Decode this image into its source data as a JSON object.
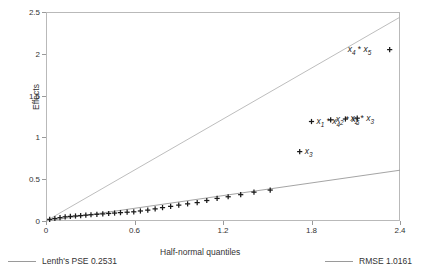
{
  "chart_data": {
    "type": "scatter",
    "title": "",
    "xlabel": "Half-normal quantiles",
    "ylabel": "Effects",
    "xlim": [
      0,
      2.4
    ],
    "ylim": [
      0,
      2.5
    ],
    "xticks": [
      "0",
      "0.6",
      "1.2",
      "1.8",
      "2.4"
    ],
    "xtick_values": [
      0,
      0.6,
      1.2,
      1.8,
      2.4
    ],
    "yticks": [
      "0",
      "0.5",
      "1",
      "1.5",
      "2",
      "2.5"
    ],
    "ytick_values": [
      0,
      0.5,
      1,
      1.5,
      2,
      2.5
    ],
    "grid": false,
    "marker": "plus",
    "x": [
      0.025,
      0.06,
      0.095,
      0.13,
      0.165,
      0.2,
      0.235,
      0.27,
      0.305,
      0.345,
      0.385,
      0.425,
      0.465,
      0.505,
      0.55,
      0.595,
      0.64,
      0.69,
      0.74,
      0.79,
      0.845,
      0.9,
      0.96,
      1.025,
      1.09,
      1.16,
      1.235,
      1.32,
      1.41,
      1.52,
      1.72,
      1.8,
      1.93,
      2.03,
      2.11,
      2.33
    ],
    "y": [
      0.02,
      0.03,
      0.04,
      0.05,
      0.055,
      0.06,
      0.065,
      0.07,
      0.075,
      0.08,
      0.085,
      0.09,
      0.095,
      0.1,
      0.105,
      0.11,
      0.12,
      0.13,
      0.145,
      0.16,
      0.175,
      0.19,
      0.205,
      0.22,
      0.245,
      0.27,
      0.29,
      0.315,
      0.345,
      0.37,
      0.83,
      1.19,
      1.21,
      1.22,
      1.23,
      2.05
    ],
    "point_labels": [
      {
        "text": "x_3",
        "x": 1.72,
        "y": 0.83,
        "side": "right"
      },
      {
        "text": "x_1 * x_4",
        "x": 1.8,
        "y": 1.19,
        "side": "right"
      },
      {
        "text": "x_2 * x_5",
        "x": 1.93,
        "y": 1.21,
        "side": "right"
      },
      {
        "text": "x_2 * x_3",
        "x": 2.03,
        "y": 1.22,
        "side": "right"
      },
      {
        "text": "x_4 * x_5",
        "x": 2.33,
        "y": 2.05,
        "side": "left"
      }
    ],
    "reference_lines": [
      {
        "name": "Lenth's PSE",
        "value": 0.2531,
        "slope": 1.0161,
        "intercept": 0,
        "color": "#b5b5b5",
        "style": "solid"
      },
      {
        "name": "RMSE",
        "value": 1.0161,
        "slope": 0.2531,
        "intercept": 0,
        "color": "#9a9a9a",
        "style": "solid"
      }
    ]
  },
  "axes": {
    "ylabel": "Effects",
    "xlabel": "Half-normal quantiles"
  },
  "labels": {
    "x3": {
      "var": "x",
      "sub": "3",
      "op": "",
      "var2": "",
      "sub2": ""
    },
    "x1x4": {
      "var": "x",
      "sub": "1",
      "op": " * ",
      "var2": "x",
      "sub2": "4"
    },
    "x2x5": {
      "var": "x",
      "sub": "2",
      "op": " * ",
      "var2": "x",
      "sub2": "5"
    },
    "x2x3": {
      "var": "x",
      "sub": "2",
      "op": " * ",
      "var2": "x",
      "sub2": "3"
    },
    "x4x5": {
      "var": "x",
      "sub": "4",
      "op": " * ",
      "var2": "x",
      "sub2": "5"
    }
  },
  "legend": {
    "left": {
      "label": "Lenth's PSE 0.2531",
      "name": "Lenth's PSE",
      "value": "0.2531",
      "color": "#9a9a9a"
    },
    "right": {
      "label": "RMSE 1.0161",
      "name": "RMSE",
      "value": "1.0161",
      "color": "#b5b5b5"
    }
  }
}
